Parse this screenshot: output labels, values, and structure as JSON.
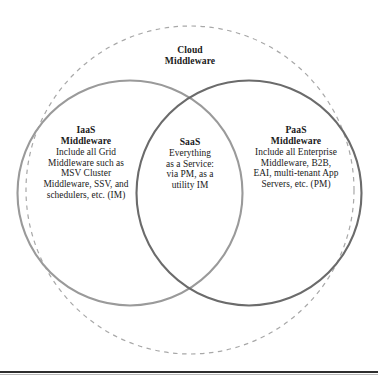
{
  "figure": {
    "type": "venn-diagram",
    "caption_top": {
      "lines": [
        "Cloud",
        "Middleware"
      ]
    },
    "sets": {
      "left": {
        "name": "IaaS Middleware",
        "title_lines": [
          "IaaS",
          "Middleware"
        ],
        "body_lines": [
          "Include all Grid",
          "Middleware such as",
          "MSV Cluster",
          "Middleware, SSV, and",
          "schedulers, etc. (IM)"
        ],
        "stroke_color": "#9a9a9a"
      },
      "center": {
        "name": "SaaS",
        "title_lines": [
          "SaaS"
        ],
        "body_lines": [
          "Everything",
          "as a Service:",
          "via PM, as a",
          "utility IM"
        ]
      },
      "right": {
        "name": "PaaS Middleware",
        "title_lines": [
          "PaaS",
          "Middleware"
        ],
        "body_lines": [
          "Include all Enterprise",
          "Middleware, B2B,",
          "EAI, multi-tenant App",
          "Servers, etc. (PM)"
        ],
        "stroke_color": "#6b6b6b"
      },
      "outer": {
        "name": "Cloud Middleware",
        "stroke_color": "#a8a8a8",
        "stroke_style": "dashed"
      }
    },
    "rule_color": "#2e2e2e",
    "background_color": "#ffffff"
  }
}
